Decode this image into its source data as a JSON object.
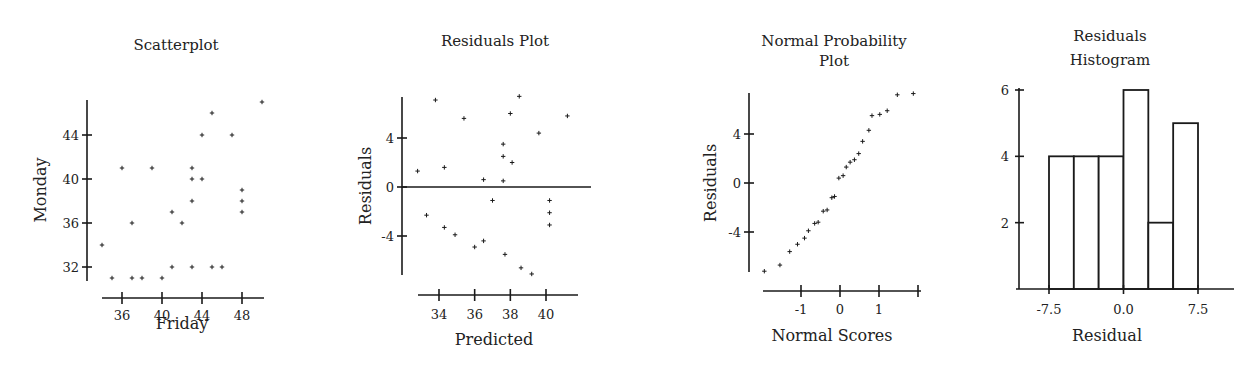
{
  "chart_data": [
    {
      "id": "scatter",
      "type": "scatter",
      "title": "Scatterplot",
      "xlabel": "Friday",
      "ylabel": "Monday",
      "xticks": [
        36,
        40,
        44,
        48
      ],
      "yticks": [
        32,
        36,
        40,
        44
      ],
      "xlim": [
        33.5,
        50.5
      ],
      "ylim": [
        30.5,
        47.5
      ],
      "grid": false,
      "points": [
        [
          34,
          34
        ],
        [
          35,
          31
        ],
        [
          36,
          41
        ],
        [
          37,
          36
        ],
        [
          37,
          31
        ],
        [
          38,
          31
        ],
        [
          39,
          41
        ],
        [
          40,
          31
        ],
        [
          41,
          37
        ],
        [
          41,
          32
        ],
        [
          42,
          36
        ],
        [
          43,
          41
        ],
        [
          43,
          40
        ],
        [
          43,
          38
        ],
        [
          43,
          32
        ],
        [
          44,
          44
        ],
        [
          44,
          40
        ],
        [
          45,
          46
        ],
        [
          45,
          32
        ],
        [
          46,
          32
        ],
        [
          47,
          44
        ],
        [
          48,
          39
        ],
        [
          48,
          38
        ],
        [
          48,
          37
        ],
        [
          50,
          47
        ]
      ]
    },
    {
      "id": "residuals",
      "type": "scatter",
      "title": "Residuals Plot",
      "xlabel": "Predicted",
      "ylabel": "Residuals",
      "xticks": [
        34,
        36,
        38,
        40
      ],
      "yticks": [
        -4,
        0,
        4
      ],
      "reference_line_y": 0,
      "grid": false,
      "points": [
        [
          32.8,
          1.3
        ],
        [
          33.8,
          7.1
        ],
        [
          33.3,
          -2.3
        ],
        [
          34.3,
          1.6
        ],
        [
          34.3,
          -3.3
        ],
        [
          34.9,
          -3.9
        ],
        [
          35.4,
          5.6
        ],
        [
          36.0,
          -4.9
        ],
        [
          36.5,
          0.6
        ],
        [
          36.5,
          -4.4
        ],
        [
          37.0,
          -1.1
        ],
        [
          37.6,
          3.5
        ],
        [
          37.6,
          2.5
        ],
        [
          37.6,
          0.5
        ],
        [
          37.7,
          -5.5
        ],
        [
          38.0,
          6.0
        ],
        [
          38.1,
          2.0
        ],
        [
          38.5,
          7.4
        ],
        [
          38.6,
          -6.6
        ],
        [
          39.2,
          -7.1
        ],
        [
          39.6,
          4.4
        ],
        [
          40.2,
          -1.1
        ],
        [
          40.2,
          -2.1
        ],
        [
          40.2,
          -3.1
        ],
        [
          41.2,
          5.8
        ]
      ]
    },
    {
      "id": "normal",
      "type": "scatter",
      "title": "Normal Probability Plot",
      "title_lines": [
        "Normal Probability",
        "Plot"
      ],
      "xlabel": "Normal Scores",
      "ylabel": "Residuals",
      "xticks": [
        -1,
        0,
        1,
        2
      ],
      "xtick_labels": [
        "-1",
        "0",
        "1",
        ""
      ],
      "yticks": [
        -4,
        0,
        4
      ],
      "grid": false,
      "points": [
        [
          -1.94,
          -7.2
        ],
        [
          -1.54,
          -6.7
        ],
        [
          -1.29,
          -5.6
        ],
        [
          -1.09,
          -5.0
        ],
        [
          -0.91,
          -4.5
        ],
        [
          -0.81,
          -3.9
        ],
        [
          -0.65,
          -3.3
        ],
        [
          -0.56,
          -3.2
        ],
        [
          -0.43,
          -2.3
        ],
        [
          -0.33,
          -2.2
        ],
        [
          -0.21,
          -1.2
        ],
        [
          -0.14,
          -1.1
        ],
        [
          -0.03,
          0.4
        ],
        [
          0.08,
          0.6
        ],
        [
          0.16,
          1.3
        ],
        [
          0.26,
          1.7
        ],
        [
          0.37,
          1.9
        ],
        [
          0.48,
          2.4
        ],
        [
          0.58,
          3.4
        ],
        [
          0.74,
          4.3
        ],
        [
          0.82,
          5.5
        ],
        [
          1.02,
          5.6
        ],
        [
          1.21,
          5.9
        ],
        [
          1.47,
          7.2
        ],
        [
          1.88,
          7.3
        ]
      ]
    },
    {
      "id": "histogram",
      "type": "bar",
      "title": "Residuals Histogram",
      "title_lines": [
        "Residuals",
        "Histogram"
      ],
      "xlabel": "Residual",
      "ylabel": "",
      "xticks": [
        -7.5,
        0.0,
        7.5
      ],
      "xtick_labels": [
        "-7.5",
        "0.0",
        "7.5"
      ],
      "yticks": [
        2,
        4,
        6
      ],
      "bin_edges": [
        -7.5,
        -5.0,
        -2.5,
        0.0,
        2.5,
        5.0,
        7.5
      ],
      "categories": [
        "-7.5 to -5.0",
        "-5.0 to -2.5",
        "-2.5 to 0.0",
        "0.0 to 2.5",
        "2.5 to 5.0",
        "5.0 to 7.5"
      ],
      "values": [
        4,
        4,
        4,
        6,
        2,
        5
      ],
      "ylim": [
        0,
        6
      ],
      "grid": false
    }
  ]
}
